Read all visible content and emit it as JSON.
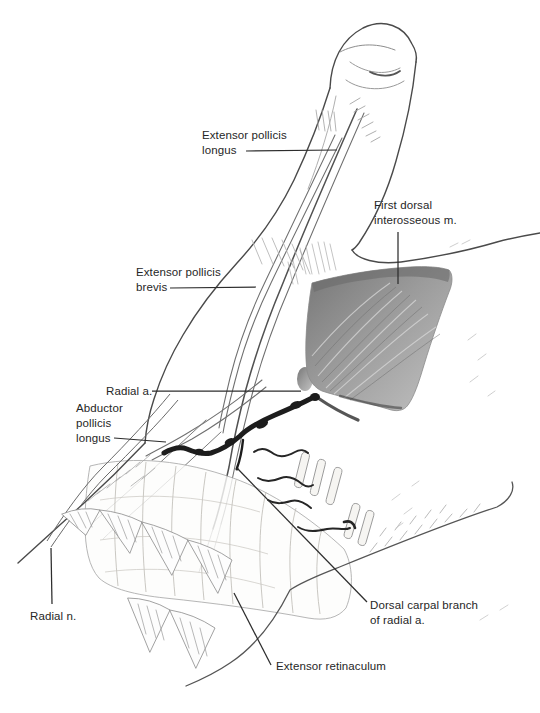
{
  "labels": {
    "extensor_pollicis_longus": {
      "text": "Extensor pollicis longus",
      "lines": [
        "Extensor pollicis",
        "longus"
      ]
    },
    "first_dorsal_interosseous": {
      "text": "First dorsal interosseous m.",
      "lines": [
        "First dorsal",
        "interosseous m."
      ]
    },
    "extensor_pollicis_brevis": {
      "text": "Extensor pollicis brevis",
      "lines": [
        "Extensor pollicis",
        "brevis"
      ]
    },
    "radial_artery": {
      "text": "Radial a.",
      "lines": [
        "Radial a."
      ]
    },
    "abductor_pollicis_longus": {
      "text": "Abductor pollicis longus",
      "lines": [
        "Abductor",
        "pollicis",
        "longus"
      ]
    },
    "radial_nerve": {
      "text": "Radial n.",
      "lines": [
        "Radial n."
      ]
    },
    "dorsal_carpal_branch": {
      "text": "Dorsal carpal branch of radial a.",
      "lines": [
        "Dorsal carpal branch",
        "of radial a."
      ]
    },
    "extensor_retinaculum": {
      "text": "Extensor retinaculum",
      "lines": [
        "Extensor retinaculum"
      ]
    }
  },
  "colors": {
    "background": "#ffffff",
    "ink": "#2d2d2d",
    "outline": "#4a4a4a",
    "artery": "#1d1d1d",
    "muscle_dark": "#6b6b6b",
    "muscle_light": "#c6c6c6"
  }
}
